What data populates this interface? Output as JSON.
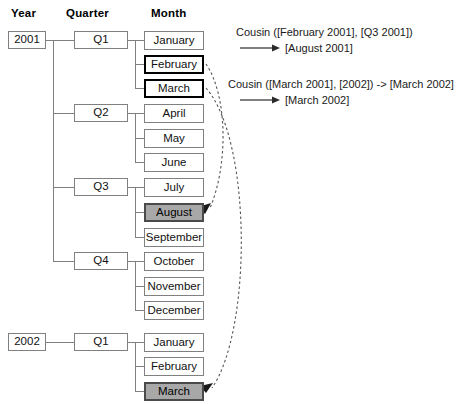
{
  "headers": [
    {
      "label": "Year",
      "x": 11,
      "y": 7
    },
    {
      "label": "Quarter",
      "x": 66,
      "y": 7
    },
    {
      "label": "Month",
      "x": 151,
      "y": 7
    }
  ],
  "years": [
    {
      "label": "2001",
      "x": 8,
      "y": 31
    },
    {
      "label": "2002",
      "x": 8,
      "y": 333
    }
  ],
  "quarters": [
    {
      "label": "Q1",
      "x": 74,
      "y": 31
    },
    {
      "label": "Q2",
      "x": 74,
      "y": 104
    },
    {
      "label": "Q3",
      "x": 74,
      "y": 178
    },
    {
      "label": "Q4",
      "x": 74,
      "y": 252
    },
    {
      "label": "Q1",
      "x": 74,
      "y": 333
    }
  ],
  "months": [
    {
      "label": "January",
      "x": 144,
      "y": 31,
      "style": "plain"
    },
    {
      "label": "February",
      "x": 144,
      "y": 55,
      "style": "bold"
    },
    {
      "label": "March",
      "x": 144,
      "y": 79,
      "style": "bold"
    },
    {
      "label": "April",
      "x": 144,
      "y": 104,
      "style": "plain"
    },
    {
      "label": "May",
      "x": 144,
      "y": 129,
      "style": "plain"
    },
    {
      "label": "June",
      "x": 144,
      "y": 153,
      "style": "plain"
    },
    {
      "label": "July",
      "x": 144,
      "y": 178,
      "style": "plain"
    },
    {
      "label": "August",
      "x": 144,
      "y": 203,
      "style": "shaded"
    },
    {
      "label": "September",
      "x": 144,
      "y": 228,
      "style": "plain"
    },
    {
      "label": "October",
      "x": 144,
      "y": 252,
      "style": "plain"
    },
    {
      "label": "November",
      "x": 144,
      "y": 277,
      "style": "plain"
    },
    {
      "label": "December",
      "x": 144,
      "y": 301,
      "style": "plain"
    },
    {
      "label": "January",
      "x": 144,
      "y": 333,
      "style": "plain"
    },
    {
      "label": "February",
      "x": 144,
      "y": 357,
      "style": "plain"
    },
    {
      "label": "March",
      "x": 144,
      "y": 382,
      "style": "shaded"
    }
  ],
  "annotations": [
    {
      "line1": "Cousin ([February 2001], [Q3 2001])",
      "result": "[August 2001]",
      "x": 236,
      "y": 27
    },
    {
      "line1": "Cousin ([March 2001], [2002]) -> [March 2002]",
      "result": "[March 2002]",
      "x": 228,
      "y": 79
    }
  ],
  "colors": {
    "box_border": "#808080",
    "bold_border": "#000000",
    "shaded_fill": "#a8a8a8",
    "shaded_border": "#4a4a4a",
    "connector": "#808080",
    "dashed_curve": "#555555",
    "text": "#111111"
  }
}
